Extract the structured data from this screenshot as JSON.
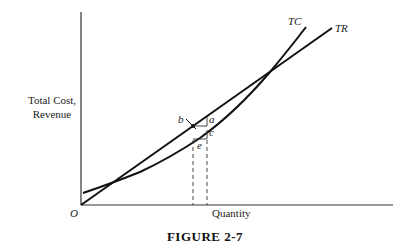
{
  "figure": {
    "caption": "FIGURE 2-7",
    "y_axis_label_line1": "Total Cost,",
    "y_axis_label_line2": "Revenue",
    "x_axis_label": "Quantity",
    "origin_label": "O",
    "curves": [
      {
        "name": "TC",
        "label": "TC",
        "shape": "convex curve"
      },
      {
        "name": "TR",
        "label": "TR",
        "shape": "straight line through origin"
      }
    ],
    "point_labels": {
      "a": "a",
      "b": "b",
      "c": "c",
      "e": "e"
    },
    "colors": {
      "line": "#111111",
      "background": "#ffffff"
    }
  }
}
